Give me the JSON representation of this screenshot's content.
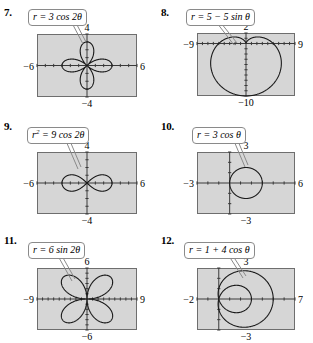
{
  "page": {
    "background_color": "#ffffff",
    "plot_fill_color": "#d6d6d6",
    "plot_border_color": "#6e6e6e",
    "curve_color": "#1a1a1a",
    "axis_color": "#3a3a3a"
  },
  "problems": [
    {
      "number": "7.",
      "equation_html": "r = 3 cos 2&theta;",
      "equation_text": "r = 3 cos 2θ",
      "labels": {
        "top": "4",
        "bottom": "−4",
        "left": "−6",
        "right": "6"
      },
      "window": {
        "xmin": -6,
        "xmax": 6,
        "ymin": -4,
        "ymax": 4
      },
      "curve_type": "rose",
      "curve_params": {
        "a": 3,
        "k": 2,
        "fn": "cos"
      }
    },
    {
      "number": "8.",
      "equation_html": "r = 5 &minus; 5 sin &theta;",
      "equation_text": "r = 5 − 5 sin θ",
      "labels": {
        "top": "2",
        "bottom": "−10",
        "left": "−9",
        "right": "9"
      },
      "window": {
        "xmin": -9,
        "xmax": 9,
        "ymin": -10,
        "ymax": 2
      },
      "curve_type": "cardioid",
      "curve_params": {
        "a": 5,
        "b": 5,
        "fn": "sin",
        "sign": -1
      }
    },
    {
      "number": "9.",
      "equation_html": "r<sup>2</sup> = 9 cos 2&theta;",
      "equation_text": "r² = 9 cos 2θ",
      "labels": {
        "top": "4",
        "bottom": "−4",
        "left": "−6",
        "right": "6"
      },
      "window": {
        "xmin": -6,
        "xmax": 6,
        "ymin": -4,
        "ymax": 4
      },
      "curve_type": "lemniscate",
      "curve_params": {
        "a2": 9,
        "fn": "cos"
      }
    },
    {
      "number": "10.",
      "equation_html": "r = 3 cos &theta;",
      "equation_text": "r = 3 cos θ",
      "labels": {
        "top": "3",
        "bottom": "−3",
        "left": "−3",
        "right": "6"
      },
      "window": {
        "xmin": -3,
        "xmax": 6,
        "ymin": -3,
        "ymax": 3
      },
      "curve_type": "circle",
      "curve_params": {
        "a": 3,
        "fn": "cos"
      }
    },
    {
      "number": "11.",
      "equation_html": "r = 6 sin 2&theta;",
      "equation_text": "r = 6 sin 2θ",
      "labels": {
        "top": "6",
        "bottom": "−6",
        "left": "−9",
        "right": "9"
      },
      "window": {
        "xmin": -9,
        "xmax": 9,
        "ymin": -6,
        "ymax": 6
      },
      "curve_type": "rose",
      "curve_params": {
        "a": 6,
        "k": 2,
        "fn": "sin"
      }
    },
    {
      "number": "12.",
      "equation_html": "r = 1 + 4 cos &theta;",
      "equation_text": "r = 1 + 4 cos θ",
      "labels": {
        "top": "3",
        "bottom": "−3",
        "left": "−2",
        "right": "7"
      },
      "window": {
        "xmin": -2,
        "xmax": 7,
        "ymin": -3,
        "ymax": 3
      },
      "curve_type": "limacon",
      "curve_params": {
        "a": 1,
        "b": 4,
        "fn": "cos"
      }
    }
  ],
  "layout": {
    "panels": [
      {
        "x": 0,
        "y": 0,
        "box": {
          "x": 37,
          "y": 34,
          "w": 100,
          "h": 63
        },
        "callout": {
          "x": 28,
          "y": 9
        },
        "leader": {
          "x1": 72,
          "y1": 23,
          "x2": 83,
          "y2": 44
        }
      },
      {
        "x": 157,
        "y": 0,
        "box": {
          "x": 40,
          "y": 33,
          "w": 98,
          "h": 63
        },
        "callout": {
          "x": 29,
          "y": 9
        },
        "leader": {
          "x1": 60,
          "y1": 23,
          "x2": 77,
          "y2": 45
        }
      },
      {
        "x": 0,
        "y": 114,
        "box": {
          "x": 37,
          "y": 38,
          "w": 100,
          "h": 62
        },
        "callout": {
          "x": 27,
          "y": 13
        },
        "leader": {
          "x1": 66,
          "y1": 27,
          "x2": 78,
          "y2": 55
        }
      },
      {
        "x": 157,
        "y": 114,
        "box": {
          "x": 40,
          "y": 38,
          "w": 98,
          "h": 62
        },
        "callout": {
          "x": 35,
          "y": 13
        },
        "leader": {
          "x1": 77,
          "y1": 27,
          "x2": 88,
          "y2": 53
        }
      },
      {
        "x": 0,
        "y": 228,
        "box": {
          "x": 37,
          "y": 40,
          "w": 100,
          "h": 62
        },
        "callout": {
          "x": 28,
          "y": 14
        },
        "leader": {
          "x1": 58,
          "y1": 28,
          "x2": 72,
          "y2": 53
        }
      },
      {
        "x": 157,
        "y": 228,
        "box": {
          "x": 40,
          "y": 40,
          "w": 98,
          "h": 62
        },
        "callout": {
          "x": 27,
          "y": 14
        },
        "leader": {
          "x1": 72,
          "y1": 28,
          "x2": 86,
          "y2": 50
        }
      }
    ]
  }
}
